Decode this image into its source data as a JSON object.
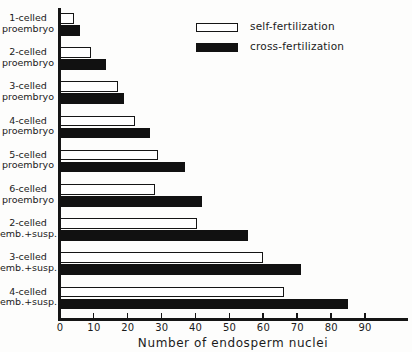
{
  "chart_data": {
    "type": "bar",
    "orientation": "horizontal",
    "title": "",
    "xlabel": "Number of endosperm nuclei",
    "ylabel": "",
    "xlim": [
      0,
      97
    ],
    "grid": false,
    "legend_position": "top-center",
    "x_ticks": [
      0,
      10,
      20,
      30,
      40,
      50,
      60,
      70,
      80,
      90
    ],
    "x_tick_labels": [
      "0",
      "10",
      "20",
      "30",
      "40",
      "50",
      "60",
      "70",
      "80",
      "90"
    ],
    "categories": [
      "1-celled proembryo",
      "2-celled proembryo",
      "3-celled proembryo",
      "4-celled proembryo",
      "5-celled proembryo",
      "6-celled proembryo",
      "2-celled emb.+susp.",
      "3-celled emb.+susp.",
      "4-celled emb.+susp."
    ],
    "category_lines": [
      [
        "1-celled",
        "proembryo"
      ],
      [
        "2-celled",
        "proembryo"
      ],
      [
        "3-celled",
        "proembryo"
      ],
      [
        "4-celled",
        "proembryo"
      ],
      [
        "5-celled",
        "proembryo"
      ],
      [
        "6-celled",
        "proembryo"
      ],
      [
        "2-celled",
        "emb.+susp."
      ],
      [
        "3-celled",
        "emb.+susp."
      ],
      [
        "4-celled",
        "emb.+susp."
      ]
    ],
    "series": [
      {
        "name": "self-fertilization",
        "color": "#ffffff",
        "edge_color": "#151515",
        "values": [
          4,
          9,
          17,
          22,
          29,
          28,
          40.5,
          60,
          66
        ]
      },
      {
        "name": "cross-fertilization",
        "color": "#111111",
        "edge_color": "#111111",
        "values": [
          6,
          13.5,
          19,
          26.5,
          37,
          42,
          55.5,
          71,
          85
        ]
      }
    ]
  },
  "legend": {
    "items": [
      {
        "label": "self-fertilization"
      },
      {
        "label": "cross-fertilization"
      }
    ]
  },
  "axis": {
    "x_title": "Number of endosperm nuclei"
  }
}
